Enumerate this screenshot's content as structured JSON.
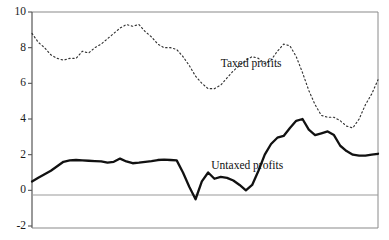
{
  "chart_data": {
    "type": "line",
    "title": "",
    "xlabel": "",
    "ylabel": "",
    "ylim": [
      -2,
      10
    ],
    "xlim": [
      0,
      100
    ],
    "yticks": [
      10,
      8,
      6,
      4,
      2,
      0,
      -2
    ],
    "ytick_labels": [
      "10",
      "8",
      "6",
      "4",
      "2",
      "0",
      "-2"
    ],
    "xticks": [],
    "xtick_labels": [],
    "grid": false,
    "zero_line": true,
    "legend_position": "inline-annotation",
    "series": [
      {
        "name": "Taxed profits",
        "style": "dotted",
        "color": "#333333",
        "label_x": 60,
        "label_y": 7.1,
        "x": [
          0,
          2,
          4,
          6,
          8,
          10,
          12,
          14,
          16,
          18,
          20,
          22,
          24,
          26,
          28,
          30,
          32,
          34,
          36,
          38,
          40,
          42,
          44,
          46,
          48,
          50,
          52,
          54,
          56,
          58,
          60,
          62,
          64,
          66,
          68,
          70,
          72,
          74,
          76,
          78,
          80,
          82,
          84,
          86,
          88,
          90,
          92,
          94,
          96,
          98,
          100
        ],
        "values": [
          8.8,
          8.3,
          8.0,
          7.6,
          7.4,
          7.3,
          7.4,
          7.4,
          7.8,
          7.7,
          8.0,
          8.2,
          8.5,
          8.8,
          9.1,
          9.3,
          9.2,
          9.3,
          8.9,
          8.6,
          8.2,
          8.0,
          8.0,
          7.9,
          7.5,
          7.0,
          6.4,
          6.0,
          5.7,
          5.7,
          5.9,
          6.3,
          6.7,
          7.0,
          7.3,
          7.5,
          7.4,
          7.1,
          7.3,
          7.8,
          8.2,
          8.1,
          7.5,
          6.6,
          5.6,
          4.8,
          4.2,
          4.1,
          4.1,
          3.9,
          3.6
        ]
      },
      {
        "name": "Untaxed profits",
        "style": "solid",
        "color": "#111111",
        "label_x": 57,
        "label_y": 1.35,
        "x": [
          0,
          2,
          4,
          6,
          8,
          10,
          12,
          14,
          16,
          18,
          20,
          22,
          24,
          26,
          28,
          30,
          32,
          34,
          36,
          38,
          40,
          42,
          44,
          46,
          48,
          50,
          52,
          54,
          56,
          58,
          60,
          62,
          64,
          66,
          68,
          70,
          72,
          74,
          76,
          78,
          80,
          82,
          84,
          86,
          88,
          90,
          92,
          94,
          96,
          98,
          100
        ],
        "values": [
          0.5,
          0.7,
          0.9,
          1.1,
          1.35,
          1.6,
          1.68,
          1.7,
          1.68,
          1.66,
          1.64,
          1.62,
          1.55,
          1.6,
          1.78,
          1.62,
          1.52,
          1.55,
          1.6,
          1.64,
          1.7,
          1.72,
          1.7,
          1.68,
          1.0,
          0.2,
          -0.5,
          0.5,
          1.0,
          0.65,
          0.75,
          0.7,
          0.55,
          0.3,
          0.0,
          0.3,
          1.1,
          2.0,
          2.6,
          2.95,
          3.05,
          3.5,
          3.9,
          4.0,
          3.4,
          3.1,
          3.2,
          3.3,
          3.1,
          2.5,
          2.2
        ]
      }
    ]
  },
  "taxed_tail": {
    "x": [
      100,
      102,
      104,
      106,
      108,
      110
    ],
    "values": [
      3.6,
      3.5,
      4.0,
      4.8,
      5.4,
      6.2
    ]
  },
  "untaxed_tail": {
    "x": [
      100,
      102,
      104,
      106,
      108,
      110
    ],
    "values": [
      2.2,
      2.0,
      1.95,
      1.95,
      2.0,
      2.05
    ]
  }
}
